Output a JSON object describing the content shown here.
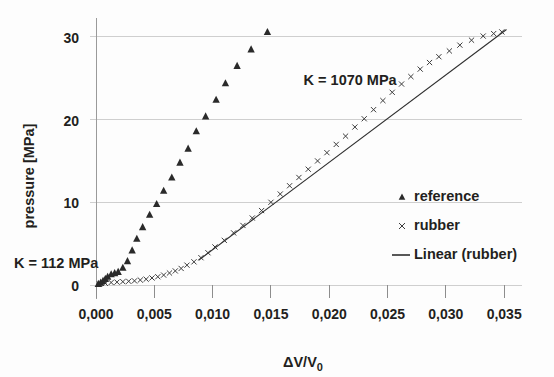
{
  "chart_data": {
    "type": "scatter",
    "title": "",
    "xlabel": "ΔV/V₀",
    "xlabel_parts": {
      "main": "ΔV/V",
      "sub": "0"
    },
    "ylabel": "pressure [MPa]",
    "xlim": [
      0.0,
      0.0355
    ],
    "ylim": [
      0.0,
      31.8
    ],
    "grid": "horizontal",
    "legend_position": "right",
    "xticks": [
      0.0,
      0.005,
      0.01,
      0.015,
      0.02,
      0.025,
      0.03,
      0.035
    ],
    "xtick_labels": [
      "0,000",
      "0,005",
      "0,010",
      "0,015",
      "0,020",
      "0,025",
      "0,030",
      "0,035"
    ],
    "yticks": [
      0,
      10,
      20,
      30
    ],
    "ytick_labels": [
      "0",
      "10",
      "20",
      "30"
    ],
    "series": [
      {
        "name": "reference",
        "marker": "triangle",
        "color": "#2a2a2a",
        "points": [
          [
            0.0002,
            0.15
          ],
          [
            0.0004,
            0.3
          ],
          [
            0.0006,
            0.5
          ],
          [
            0.0008,
            0.75
          ],
          [
            0.001,
            1.0
          ],
          [
            0.0013,
            1.3
          ],
          [
            0.0016,
            1.45
          ],
          [
            0.0019,
            1.6
          ],
          [
            0.0023,
            2.1
          ],
          [
            0.0027,
            2.9
          ],
          [
            0.0031,
            4.2
          ],
          [
            0.0035,
            5.6
          ],
          [
            0.004,
            7.0
          ],
          [
            0.0046,
            8.5
          ],
          [
            0.0052,
            9.8
          ],
          [
            0.0058,
            11.4
          ],
          [
            0.0065,
            13.0
          ],
          [
            0.0072,
            14.8
          ],
          [
            0.0079,
            16.5
          ],
          [
            0.0086,
            18.6
          ],
          [
            0.0094,
            20.4
          ],
          [
            0.0103,
            22.4
          ],
          [
            0.0111,
            24.4
          ],
          [
            0.0121,
            26.5
          ],
          [
            0.0133,
            28.5
          ],
          [
            0.0147,
            30.6
          ]
        ]
      },
      {
        "name": "rubber",
        "marker": "x",
        "color": "#3d3d3d",
        "points": [
          [
            0.0003,
            0.1
          ],
          [
            0.0008,
            0.2
          ],
          [
            0.0013,
            0.3
          ],
          [
            0.0018,
            0.35
          ],
          [
            0.0023,
            0.4
          ],
          [
            0.0028,
            0.45
          ],
          [
            0.0033,
            0.5
          ],
          [
            0.0038,
            0.6
          ],
          [
            0.0043,
            0.7
          ],
          [
            0.0048,
            0.85
          ],
          [
            0.0053,
            1.0
          ],
          [
            0.0058,
            1.2
          ],
          [
            0.0063,
            1.45
          ],
          [
            0.0068,
            1.7
          ],
          [
            0.0073,
            2.0
          ],
          [
            0.0078,
            2.4
          ],
          [
            0.0084,
            2.8
          ],
          [
            0.009,
            3.3
          ],
          [
            0.0096,
            3.9
          ],
          [
            0.0102,
            4.6
          ],
          [
            0.011,
            5.4
          ],
          [
            0.0118,
            6.3
          ],
          [
            0.0126,
            7.2
          ],
          [
            0.0134,
            8.1
          ],
          [
            0.0142,
            9.0
          ],
          [
            0.015,
            10.0
          ],
          [
            0.0158,
            11.0
          ],
          [
            0.0166,
            12.0
          ],
          [
            0.0174,
            13.0
          ],
          [
            0.0182,
            14.0
          ],
          [
            0.019,
            15.0
          ],
          [
            0.0198,
            16.0
          ],
          [
            0.0206,
            17.0
          ],
          [
            0.0214,
            18.0
          ],
          [
            0.0222,
            19.1
          ],
          [
            0.023,
            20.1
          ],
          [
            0.0238,
            21.2
          ],
          [
            0.0246,
            22.3
          ],
          [
            0.0254,
            23.3
          ],
          [
            0.0262,
            24.3
          ],
          [
            0.027,
            25.2
          ],
          [
            0.0278,
            26.1
          ],
          [
            0.0286,
            26.9
          ],
          [
            0.0294,
            27.6
          ],
          [
            0.0303,
            28.3
          ],
          [
            0.0312,
            29.0
          ],
          [
            0.0322,
            29.6
          ],
          [
            0.0332,
            30.1
          ],
          [
            0.0341,
            30.4
          ],
          [
            0.0348,
            30.6
          ]
        ]
      }
    ],
    "fit_line": {
      "name": "Linear (rubber)",
      "x_start": 0.0088,
      "x_end": 0.0352,
      "y_start": 3.0,
      "y_end": 30.9,
      "slope_label": "K = 1070 MPa"
    },
    "annotations": [
      {
        "id": "k-high",
        "text": "K = 1070 MPa",
        "x": 0.0178,
        "y": 24.2
      },
      {
        "id": "k-low",
        "text": "K = 112 MPa",
        "x": 0.0006,
        "y": 3.7
      }
    ]
  },
  "legend": {
    "items": [
      {
        "label": "reference",
        "marker": "triangle"
      },
      {
        "label": "rubber",
        "marker": "x"
      },
      {
        "label": "Linear (rubber)",
        "marker": "line"
      }
    ]
  },
  "colors": {
    "marker_reference": "#2a2a2a",
    "marker_rubber": "#3d3d3d",
    "fit_line": "#2f2f2f",
    "gridline": "#cfcfcf",
    "axis": "#9a9a9a",
    "text": "#231f20",
    "background": "#fdfdfd"
  }
}
